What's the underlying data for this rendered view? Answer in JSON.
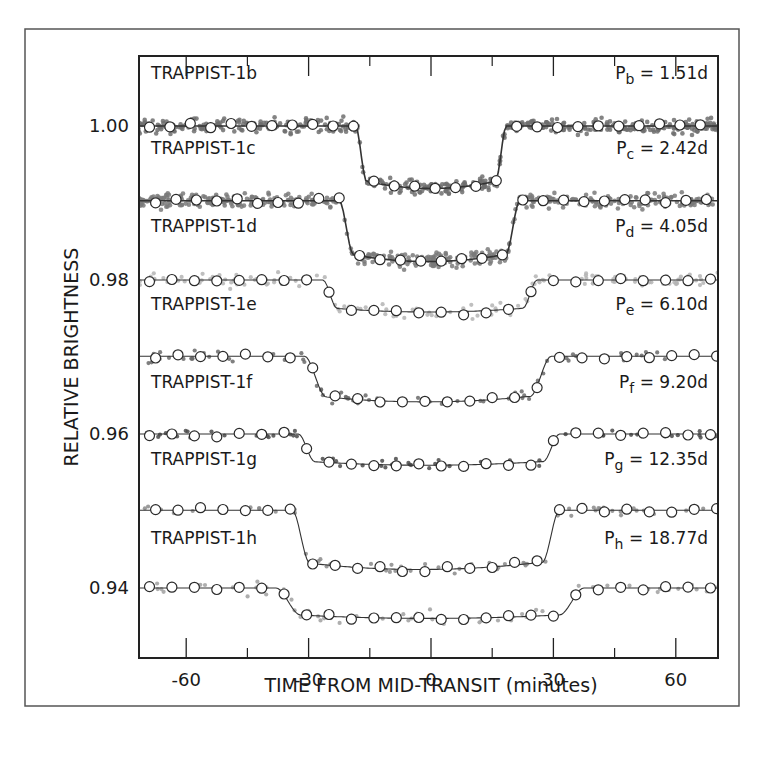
{
  "chart_data": {
    "type": "scatter",
    "title": "",
    "xlabel": "TIME FROM MID-TRANSIT (minutes)",
    "ylabel": "RELATIVE BRIGHTNESS",
    "xlim": [
      -70,
      70
    ],
    "ylim": [
      0.931,
      1.009
    ],
    "x_ticks": [
      -60,
      -30,
      0,
      30,
      60
    ],
    "x_minor_ticks": [
      -45,
      -15,
      15,
      45
    ],
    "y_ticks": [
      1.0,
      0.98,
      0.96,
      0.94
    ],
    "y_tick_labels": [
      "1.00",
      "0.98",
      "0.96",
      "0.94"
    ],
    "grid": false,
    "legend": null,
    "note": "Light curves are vertically offset for clarity; each series has its own baseline.",
    "series": [
      {
        "name": "TRAPPIST-1b",
        "period_label": "P",
        "period_sub": "b",
        "period_value": "= 1.51d",
        "baseline": 1.0,
        "depth": 0.0078,
        "t1": -18.5,
        "t2": -15.8,
        "t3": 15.8,
        "t4": 18.5,
        "point_color": "#6e6e6e",
        "density": "high",
        "noise": 0.0011
      },
      {
        "name": "TRAPPIST-1c",
        "period_label": "P",
        "period_sub": "c",
        "period_value": "= 2.42d",
        "baseline": 0.9903,
        "depth": 0.0076,
        "t1": -22.5,
        "t2": -18.9,
        "t3": 18.4,
        "t4": 21.8,
        "point_color": "#7a7a7a",
        "density": "high",
        "noise": 0.0011
      },
      {
        "name": "TRAPPIST-1d",
        "period_label": "P",
        "period_sub": "d",
        "period_value": "= 4.05d",
        "baseline": 0.98,
        "depth": 0.004,
        "t1": -26.5,
        "t2": -23.0,
        "t3": 22.5,
        "t4": 26.0,
        "point_color": "#b4b4b4",
        "density": "medium",
        "noise": 0.001
      },
      {
        "name": "TRAPPIST-1e",
        "period_label": "P",
        "period_sub": "e",
        "period_value": "= 6.10d",
        "baseline": 0.9701,
        "depth": 0.0057,
        "t1": -31.0,
        "t2": -25.5,
        "t3": 24.5,
        "t4": 29.5,
        "point_color": "#6a6a6a",
        "density": "low",
        "noise": 0.0009
      },
      {
        "name": "TRAPPIST-1f",
        "period_label": "P",
        "period_sub": "f",
        "period_value": "= 9.20d",
        "baseline": 0.96,
        "depth": 0.0039,
        "t1": -32.5,
        "t2": -28.5,
        "t3": 27.5,
        "t4": 31.5,
        "point_color": "#4a4a4a",
        "density": "low",
        "noise": 0.0008
      },
      {
        "name": "TRAPPIST-1g",
        "period_label": "P",
        "period_sub": "g",
        "period_value": "= 12.35d",
        "baseline": 0.9501,
        "depth": 0.0074,
        "t1": -34.0,
        "t2": -30.5,
        "t3": 26.5,
        "t4": 31.5,
        "point_color": "#8a8a8a",
        "density": "low",
        "noise": 0.001
      },
      {
        "name": "TRAPPIST-1h",
        "period_label": "P",
        "period_sub": "h",
        "period_value": "= 18.77d",
        "baseline": 0.94,
        "depth": 0.0038,
        "t1": -38.0,
        "t2": -31.0,
        "t3": 32.5,
        "t4": 37.5,
        "point_color": "#a0a0a0",
        "density": "low",
        "noise": 0.001
      }
    ],
    "binned_marker": "open-circle",
    "model_line": "solid dark gray"
  },
  "figure": {
    "frame_color": "#222222",
    "outer_border_color": "#555555",
    "line_color": "#333333"
  }
}
